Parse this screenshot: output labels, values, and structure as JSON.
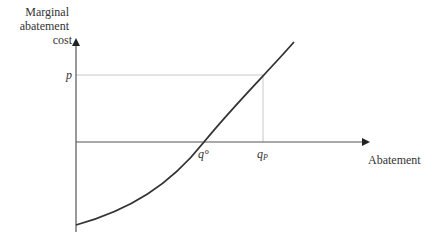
{
  "diagram": {
    "y_axis": {
      "label_lines": [
        "Marginal",
        "abatement",
        "cost"
      ]
    },
    "x_axis": {
      "label": "Abatement"
    },
    "price_label": "p",
    "q0_label": "q°",
    "qp_label": "qp",
    "qp_label_main": "q",
    "qp_label_sub": "P",
    "colors": {
      "axis": "#555555",
      "curve": "#333333",
      "guide": "#c8c8c8",
      "text": "#333333"
    }
  }
}
